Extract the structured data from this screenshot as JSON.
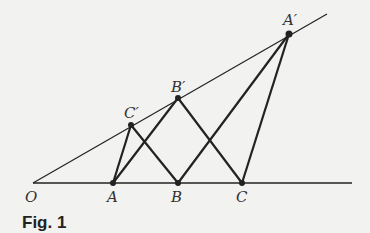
{
  "figure": {
    "caption": "Fig. 1",
    "points": {
      "O": {
        "label": "O",
        "x": 33,
        "y": 183
      },
      "A": {
        "label": "A",
        "x": 113,
        "y": 183
      },
      "B": {
        "label": "B",
        "x": 178,
        "y": 183
      },
      "C": {
        "label": "C",
        "x": 242,
        "y": 183
      },
      "C_prime": {
        "label": "C′",
        "x": 131,
        "y": 125
      },
      "B_prime": {
        "label": "B′",
        "x": 178,
        "y": 98
      },
      "A_prime": {
        "label": "A′",
        "x": 289,
        "y": 34
      }
    },
    "rays": [
      {
        "name": "baseline",
        "from": "O",
        "to": [
          352,
          183
        ]
      },
      {
        "name": "upper-ray",
        "from": "O",
        "to": [
          327,
          14
        ]
      }
    ],
    "segments": [
      [
        "A",
        "C_prime"
      ],
      [
        "C_prime",
        "B"
      ],
      [
        "A",
        "B_prime"
      ],
      [
        "B_prime",
        "C"
      ],
      [
        "A",
        "A_prime"
      ],
      [
        "B",
        "A_prime"
      ],
      [
        "C",
        "A_prime"
      ]
    ]
  }
}
